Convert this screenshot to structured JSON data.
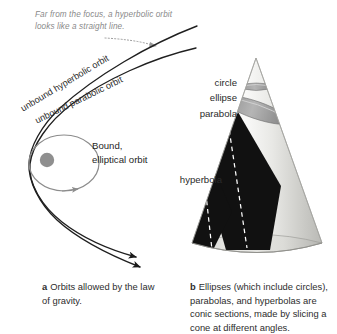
{
  "figure": {
    "panel_a": {
      "annotation": "Far from the focus, a hyperbolic orbit looks like a straight line.",
      "labels": {
        "hyperbolic": "unbound hyperbolic orbit",
        "parabolic": "unbound parabolic orbit",
        "bound": "Bound, elliptical orbit"
      },
      "caption_letter": "a",
      "caption_text": "Orbits allowed by the law of gravity."
    },
    "panel_b": {
      "labels": {
        "circle": "circle",
        "ellipse": "ellipse",
        "parabola": "parabola",
        "hyperbola": "hyperbola"
      },
      "caption_letter": "b",
      "caption_text": "Ellipses (which include circles), parabolas, and hyperbolas are conic sections, made by slicing a cone at different angles."
    },
    "colors": {
      "curve_dark": "#1a1a1a",
      "ellipse_gray": "#8c8c8c",
      "focus_dot": "#8f8f8f",
      "annotation_gray": "#8a8a8a",
      "cone_light": "#ededea",
      "cone_shade": "#c6c6c2",
      "section_dark": "#111111",
      "band_gray": "#9a9a9a",
      "dash_white": "#ffffff",
      "text": "#262626",
      "background": "#ffffff"
    }
  }
}
